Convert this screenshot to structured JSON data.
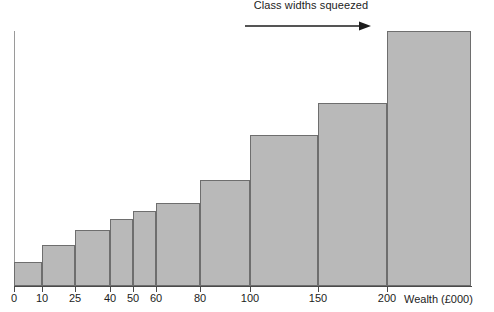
{
  "annotation": {
    "text": "Class widths squeezed",
    "arrow_direction": "right",
    "arrow_icon": "arrow-right-icon"
  },
  "axis": {
    "x_title": "Wealth (£000)",
    "tick_labels": [
      "0",
      "10",
      "25",
      "40",
      "50",
      "60",
      "80",
      "100",
      "150",
      "200"
    ],
    "y_title": ""
  },
  "colors": {
    "bar_fill": "#b9b9b9",
    "bar_stroke": "#6e6e6e",
    "axis": "#4a4a4a",
    "text": "#1c1c1c"
  },
  "chart_data": {
    "type": "bar",
    "title": "",
    "subtitle": "",
    "xlabel": "Wealth (£000)",
    "ylabel": "",
    "grid": false,
    "legend": false,
    "note": "Histogram with unequal class widths drawn on a squeezed (non-linear) horizontal scale; bar heights are frequency densities read as pixel heights above the axis.",
    "x_scale": "non-linear (class widths squeezed toward the right)",
    "class_boundaries": [
      0,
      10,
      25,
      40,
      50,
      60,
      80,
      100,
      150,
      200,
      250
    ],
    "categories": [
      "0-10",
      "10-25",
      "25-40",
      "40-50",
      "50-60",
      "60-80",
      "80-100",
      "100-150",
      "150-200",
      "200+"
    ],
    "values": [
      24,
      41,
      56,
      67,
      75,
      83,
      106,
      151,
      183,
      255
    ],
    "ylim": [
      0,
      260
    ],
    "bars": [
      {
        "label": "0-10",
        "x0": 0,
        "x1": 10,
        "value": 24,
        "px_left": 14,
        "px_right": 42,
        "px_top": 262
      },
      {
        "label": "10-25",
        "x0": 10,
        "x1": 25,
        "value": 41,
        "px_left": 42,
        "px_right": 75,
        "px_top": 245
      },
      {
        "label": "25-40",
        "x0": 25,
        "x1": 40,
        "value": 56,
        "px_left": 75,
        "px_right": 110,
        "px_top": 230
      },
      {
        "label": "40-50",
        "x0": 40,
        "x1": 50,
        "value": 67,
        "px_left": 110,
        "px_right": 133,
        "px_top": 219
      },
      {
        "label": "50-60",
        "x0": 50,
        "x1": 60,
        "value": 75,
        "px_left": 133,
        "px_right": 156,
        "px_top": 211
      },
      {
        "label": "60-80",
        "x0": 60,
        "x1": 80,
        "value": 83,
        "px_left": 156,
        "px_right": 200,
        "px_top": 203
      },
      {
        "label": "80-100",
        "x0": 80,
        "x1": 100,
        "value": 106,
        "px_left": 200,
        "px_right": 250,
        "px_top": 180
      },
      {
        "label": "100-150",
        "x0": 100,
        "x1": 150,
        "value": 151,
        "px_left": 250,
        "px_right": 318,
        "px_top": 135
      },
      {
        "label": "150-200",
        "x0": 150,
        "x1": 200,
        "value": 183,
        "px_left": 318,
        "px_right": 387,
        "px_top": 103
      },
      {
        "label": "200+",
        "x0": 200,
        "x1": 250,
        "value": 255,
        "px_left": 387,
        "px_right": 471,
        "px_top": 31
      }
    ],
    "ticks": [
      {
        "label": "0",
        "px_x": 14
      },
      {
        "label": "10",
        "px_x": 42
      },
      {
        "label": "25",
        "px_x": 75
      },
      {
        "label": "40",
        "px_x": 110
      },
      {
        "label": "50",
        "px_x": 133
      },
      {
        "label": "60",
        "px_x": 156
      },
      {
        "label": "80",
        "px_x": 200
      },
      {
        "label": "100",
        "px_x": 250
      },
      {
        "label": "150",
        "px_x": 318
      },
      {
        "label": "200",
        "px_x": 387
      }
    ]
  }
}
